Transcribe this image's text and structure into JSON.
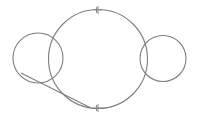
{
  "figure": {
    "title": "Two small circles overlapping a large circle with a tangent line",
    "width": 197,
    "height": 120,
    "background_color": "#ffffff",
    "stroke_color": "#7d7d7d",
    "marker_color": "#8a8a8a",
    "stroke_width": 1.1,
    "shapes": [
      {
        "name": "large-circle",
        "type": "circle",
        "cx": 98,
        "cy": 59,
        "r": 49.5,
        "label": "Large circle"
      },
      {
        "name": "left-circle",
        "type": "circle",
        "cx": 38,
        "cy": 58,
        "r": 25,
        "label": "Left small circle"
      },
      {
        "name": "right-circle",
        "type": "circle",
        "cx": 163,
        "cy": 58.5,
        "r": 23,
        "label": "Right small circle"
      },
      {
        "name": "tangent-line",
        "type": "line",
        "x1": 21,
        "y1": 73,
        "x2": 88,
        "y2": 107,
        "label": "Tangent line from left circle to large circle"
      }
    ],
    "markers": [
      {
        "name": "top-tick-marker",
        "type": "cross-tick",
        "x": 98,
        "y": 10,
        "label": "Top vertex marker"
      },
      {
        "name": "bottom-tick-marker",
        "type": "cross-tick",
        "x": 98,
        "y": 108,
        "label": "Bottom vertex marker"
      }
    ]
  }
}
